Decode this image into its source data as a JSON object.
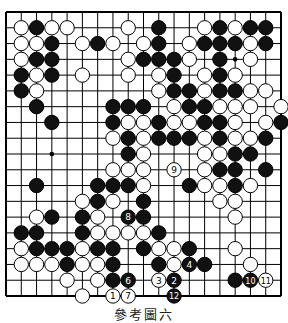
{
  "diagram": {
    "type": "go-board",
    "size": 19,
    "caption": "參考圖六",
    "colors": {
      "line": "#000000",
      "black": "#111111",
      "white": "#ffffff",
      "background": "#ffffff"
    },
    "hoshi": [
      [
        3,
        3
      ],
      [
        3,
        9
      ],
      [
        3,
        15
      ],
      [
        9,
        3
      ],
      [
        9,
        9
      ],
      [
        9,
        15
      ],
      [
        15,
        3
      ],
      [
        15,
        9
      ],
      [
        15,
        15
      ]
    ],
    "stones": [
      {
        "r": 1,
        "c": 1,
        "color": "W"
      },
      {
        "r": 1,
        "c": 2,
        "color": "B"
      },
      {
        "r": 1,
        "c": 3,
        "color": "W"
      },
      {
        "r": 1,
        "c": 4,
        "color": "W"
      },
      {
        "r": 1,
        "c": 8,
        "color": "W"
      },
      {
        "r": 1,
        "c": 10,
        "color": "B"
      },
      {
        "r": 1,
        "c": 13,
        "color": "W"
      },
      {
        "r": 1,
        "c": 14,
        "color": "B"
      },
      {
        "r": 1,
        "c": 15,
        "color": "W"
      },
      {
        "r": 1,
        "c": 16,
        "color": "B"
      },
      {
        "r": 1,
        "c": 17,
        "color": "B"
      },
      {
        "r": 2,
        "c": 1,
        "color": "W"
      },
      {
        "r": 2,
        "c": 2,
        "color": "W"
      },
      {
        "r": 2,
        "c": 3,
        "color": "B"
      },
      {
        "r": 2,
        "c": 5,
        "color": "W"
      },
      {
        "r": 2,
        "c": 6,
        "color": "B"
      },
      {
        "r": 2,
        "c": 7,
        "color": "W"
      },
      {
        "r": 2,
        "c": 9,
        "color": "W"
      },
      {
        "r": 2,
        "c": 10,
        "color": "B"
      },
      {
        "r": 2,
        "c": 12,
        "color": "W"
      },
      {
        "r": 2,
        "c": 13,
        "color": "B"
      },
      {
        "r": 2,
        "c": 14,
        "color": "B"
      },
      {
        "r": 2,
        "c": 15,
        "color": "B"
      },
      {
        "r": 2,
        "c": 16,
        "color": "W"
      },
      {
        "r": 2,
        "c": 17,
        "color": "B"
      },
      {
        "r": 3,
        "c": 1,
        "color": "W"
      },
      {
        "r": 3,
        "c": 2,
        "color": "B"
      },
      {
        "r": 3,
        "c": 3,
        "color": "B"
      },
      {
        "r": 3,
        "c": 8,
        "color": "W"
      },
      {
        "r": 3,
        "c": 9,
        "color": "B"
      },
      {
        "r": 3,
        "c": 10,
        "color": "B"
      },
      {
        "r": 3,
        "c": 11,
        "color": "B"
      },
      {
        "r": 3,
        "c": 12,
        "color": "W"
      },
      {
        "r": 3,
        "c": 14,
        "color": "B"
      },
      {
        "r": 3,
        "c": 16,
        "color": "W"
      },
      {
        "r": 4,
        "c": 1,
        "color": "B"
      },
      {
        "r": 4,
        "c": 2,
        "color": "W"
      },
      {
        "r": 4,
        "c": 3,
        "color": "B"
      },
      {
        "r": 4,
        "c": 5,
        "color": "W"
      },
      {
        "r": 4,
        "c": 8,
        "color": "W"
      },
      {
        "r": 4,
        "c": 10,
        "color": "W"
      },
      {
        "r": 4,
        "c": 11,
        "color": "B"
      },
      {
        "r": 4,
        "c": 13,
        "color": "W"
      },
      {
        "r": 4,
        "c": 14,
        "color": "B"
      },
      {
        "r": 4,
        "c": 15,
        "color": "W"
      },
      {
        "r": 5,
        "c": 1,
        "color": "B"
      },
      {
        "r": 5,
        "c": 2,
        "color": "W"
      },
      {
        "r": 5,
        "c": 10,
        "color": "W"
      },
      {
        "r": 5,
        "c": 11,
        "color": "B"
      },
      {
        "r": 5,
        "c": 12,
        "color": "B"
      },
      {
        "r": 5,
        "c": 13,
        "color": "W"
      },
      {
        "r": 5,
        "c": 14,
        "color": "B"
      },
      {
        "r": 5,
        "c": 15,
        "color": "B"
      },
      {
        "r": 5,
        "c": 16,
        "color": "W"
      },
      {
        "r": 5,
        "c": 17,
        "color": "W"
      },
      {
        "r": 6,
        "c": 2,
        "color": "B"
      },
      {
        "r": 6,
        "c": 7,
        "color": "B"
      },
      {
        "r": 6,
        "c": 8,
        "color": "B"
      },
      {
        "r": 6,
        "c": 9,
        "color": "B"
      },
      {
        "r": 6,
        "c": 11,
        "color": "W"
      },
      {
        "r": 6,
        "c": 12,
        "color": "B"
      },
      {
        "r": 6,
        "c": 13,
        "color": "B"
      },
      {
        "r": 6,
        "c": 14,
        "color": "W"
      },
      {
        "r": 6,
        "c": 15,
        "color": "W"
      },
      {
        "r": 6,
        "c": 16,
        "color": "W"
      },
      {
        "r": 6,
        "c": 18,
        "color": "W"
      },
      {
        "r": 7,
        "c": 3,
        "color": "B"
      },
      {
        "r": 7,
        "c": 7,
        "color": "B"
      },
      {
        "r": 7,
        "c": 8,
        "color": "W"
      },
      {
        "r": 7,
        "c": 9,
        "color": "W"
      },
      {
        "r": 7,
        "c": 10,
        "color": "B"
      },
      {
        "r": 7,
        "c": 11,
        "color": "W"
      },
      {
        "r": 7,
        "c": 12,
        "color": "W"
      },
      {
        "r": 7,
        "c": 13,
        "color": "B"
      },
      {
        "r": 7,
        "c": 14,
        "color": "B"
      },
      {
        "r": 7,
        "c": 15,
        "color": "W"
      },
      {
        "r": 7,
        "c": 17,
        "color": "W"
      },
      {
        "r": 7,
        "c": 18,
        "color": "B"
      },
      {
        "r": 8,
        "c": 7,
        "color": "W"
      },
      {
        "r": 8,
        "c": 8,
        "color": "B"
      },
      {
        "r": 8,
        "c": 9,
        "color": "W"
      },
      {
        "r": 8,
        "c": 10,
        "color": "B"
      },
      {
        "r": 8,
        "c": 11,
        "color": "B"
      },
      {
        "r": 8,
        "c": 12,
        "color": "B"
      },
      {
        "r": 8,
        "c": 13,
        "color": "W"
      },
      {
        "r": 8,
        "c": 14,
        "color": "B"
      },
      {
        "r": 8,
        "c": 15,
        "color": "W"
      },
      {
        "r": 8,
        "c": 16,
        "color": "W"
      },
      {
        "r": 8,
        "c": 17,
        "color": "B"
      },
      {
        "r": 9,
        "c": 8,
        "color": "B"
      },
      {
        "r": 9,
        "c": 9,
        "color": "W"
      },
      {
        "r": 9,
        "c": 13,
        "color": "W"
      },
      {
        "r": 9,
        "c": 14,
        "color": "W"
      },
      {
        "r": 9,
        "c": 15,
        "color": "B"
      },
      {
        "r": 9,
        "c": 16,
        "color": "B"
      },
      {
        "r": 10,
        "c": 7,
        "color": "W"
      },
      {
        "r": 10,
        "c": 8,
        "color": "W"
      },
      {
        "r": 10,
        "c": 9,
        "color": "W"
      },
      {
        "r": 10,
        "c": 11,
        "color": "W",
        "label": "9"
      },
      {
        "r": 10,
        "c": 13,
        "color": "W"
      },
      {
        "r": 10,
        "c": 14,
        "color": "B"
      },
      {
        "r": 10,
        "c": 15,
        "color": "B"
      },
      {
        "r": 10,
        "c": 17,
        "color": "B"
      },
      {
        "r": 11,
        "c": 2,
        "color": "B"
      },
      {
        "r": 11,
        "c": 6,
        "color": "B"
      },
      {
        "r": 11,
        "c": 7,
        "color": "B"
      },
      {
        "r": 11,
        "c": 8,
        "color": "B"
      },
      {
        "r": 11,
        "c": 9,
        "color": "W"
      },
      {
        "r": 11,
        "c": 12,
        "color": "B"
      },
      {
        "r": 11,
        "c": 13,
        "color": "W"
      },
      {
        "r": 11,
        "c": 14,
        "color": "W"
      },
      {
        "r": 11,
        "c": 15,
        "color": "B"
      },
      {
        "r": 11,
        "c": 16,
        "color": "W"
      },
      {
        "r": 12,
        "c": 5,
        "color": "W"
      },
      {
        "r": 12,
        "c": 6,
        "color": "B"
      },
      {
        "r": 12,
        "c": 7,
        "color": "W"
      },
      {
        "r": 12,
        "c": 9,
        "color": "B"
      },
      {
        "r": 12,
        "c": 14,
        "color": "W"
      },
      {
        "r": 12,
        "c": 15,
        "color": "W"
      },
      {
        "r": 13,
        "c": 2,
        "color": "W"
      },
      {
        "r": 13,
        "c": 3,
        "color": "B"
      },
      {
        "r": 13,
        "c": 5,
        "color": "B"
      },
      {
        "r": 13,
        "c": 6,
        "color": "W"
      },
      {
        "r": 13,
        "c": 8,
        "color": "B",
        "label": "8"
      },
      {
        "r": 13,
        "c": 9,
        "color": "B"
      },
      {
        "r": 13,
        "c": 15,
        "color": "W"
      },
      {
        "r": 14,
        "c": 1,
        "color": "B"
      },
      {
        "r": 14,
        "c": 2,
        "color": "B"
      },
      {
        "r": 14,
        "c": 5,
        "color": "B"
      },
      {
        "r": 14,
        "c": 6,
        "color": "W"
      },
      {
        "r": 14,
        "c": 7,
        "color": "W"
      },
      {
        "r": 14,
        "c": 8,
        "color": "W"
      },
      {
        "r": 14,
        "c": 9,
        "color": "W"
      },
      {
        "r": 14,
        "c": 10,
        "color": "B"
      },
      {
        "r": 15,
        "c": 1,
        "color": "W"
      },
      {
        "r": 15,
        "c": 2,
        "color": "B"
      },
      {
        "r": 15,
        "c": 3,
        "color": "B"
      },
      {
        "r": 15,
        "c": 4,
        "color": "B"
      },
      {
        "r": 15,
        "c": 5,
        "color": "W"
      },
      {
        "r": 15,
        "c": 6,
        "color": "B"
      },
      {
        "r": 15,
        "c": 7,
        "color": "B"
      },
      {
        "r": 15,
        "c": 9,
        "color": "B"
      },
      {
        "r": 15,
        "c": 10,
        "color": "W"
      },
      {
        "r": 15,
        "c": 11,
        "color": "W"
      },
      {
        "r": 15,
        "c": 12,
        "color": "B"
      },
      {
        "r": 15,
        "c": 15,
        "color": "W"
      },
      {
        "r": 16,
        "c": 1,
        "color": "W"
      },
      {
        "r": 16,
        "c": 2,
        "color": "W"
      },
      {
        "r": 16,
        "c": 3,
        "color": "W"
      },
      {
        "r": 16,
        "c": 4,
        "color": "B"
      },
      {
        "r": 16,
        "c": 5,
        "color": "W"
      },
      {
        "r": 16,
        "c": 6,
        "color": "W"
      },
      {
        "r": 16,
        "c": 7,
        "color": "B"
      },
      {
        "r": 16,
        "c": 10,
        "color": "B"
      },
      {
        "r": 16,
        "c": 11,
        "color": "W"
      },
      {
        "r": 16,
        "c": 12,
        "color": "B",
        "label": "4"
      },
      {
        "r": 16,
        "c": 13,
        "color": "B"
      },
      {
        "r": 16,
        "c": 16,
        "color": "W"
      },
      {
        "r": 17,
        "c": 4,
        "color": "W"
      },
      {
        "r": 17,
        "c": 6,
        "color": "W"
      },
      {
        "r": 17,
        "c": 7,
        "color": "B"
      },
      {
        "r": 17,
        "c": 8,
        "color": "B",
        "label": "6"
      },
      {
        "r": 17,
        "c": 10,
        "color": "W",
        "label": "3"
      },
      {
        "r": 17,
        "c": 11,
        "color": "B",
        "label": "2"
      },
      {
        "r": 17,
        "c": 15,
        "color": "B"
      },
      {
        "r": 17,
        "c": 16,
        "color": "B",
        "label": "10"
      },
      {
        "r": 17,
        "c": 17,
        "color": "W",
        "label": "11"
      },
      {
        "r": 18,
        "c": 5,
        "color": "W"
      },
      {
        "r": 18,
        "c": 7,
        "color": "W",
        "label": "1"
      },
      {
        "r": 18,
        "c": 8,
        "color": "W",
        "label": "7"
      },
      {
        "r": 18,
        "c": 11,
        "color": "B",
        "label": "12"
      }
    ]
  }
}
